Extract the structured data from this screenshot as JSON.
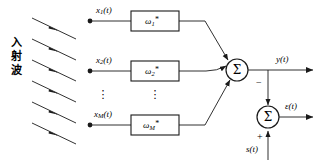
{
  "figure": {
    "type": "adaptive-array-beamformer-block-diagram",
    "caption_vertical": [
      "入",
      "射",
      "波"
    ],
    "caption_text": "入射波",
    "line_color": "#1a1a1a",
    "background": "#ffffff"
  },
  "incident_waves": {
    "count": 6,
    "arrow_direction": "down-right",
    "label": "incident plane waves"
  },
  "channels": [
    {
      "signal": "x",
      "signal_sub": "1",
      "signal_arg": "(t)",
      "weight": "ω",
      "weight_sub": "1",
      "weight_sup": "*"
    },
    {
      "signal": "x",
      "signal_sub": "2",
      "signal_arg": "(t)",
      "weight": "ω",
      "weight_sub": "2",
      "weight_sup": "*"
    },
    {
      "signal": "x",
      "signal_sub": "M",
      "signal_arg": "(t)",
      "weight": "ω",
      "weight_sub": "M",
      "weight_sup": "*"
    }
  ],
  "ellipsis": {
    "glyph": "⋮",
    "signal_column": "⋮",
    "weight_column": "⋮"
  },
  "summers": [
    {
      "name": "array-output-summer",
      "glyph": "Σ",
      "output_label": "y(t)"
    },
    {
      "name": "error-summer",
      "glyph": "Σ",
      "output_label": "ε(t)"
    }
  ],
  "outputs": {
    "array_output": "y(t)",
    "error_output": "ε(t)"
  },
  "reference": {
    "signal": "s(t)",
    "sign": "+"
  },
  "feedback": {
    "from": "y(t)",
    "sign": "−"
  },
  "signs": {
    "minus": "−",
    "plus": "+"
  }
}
